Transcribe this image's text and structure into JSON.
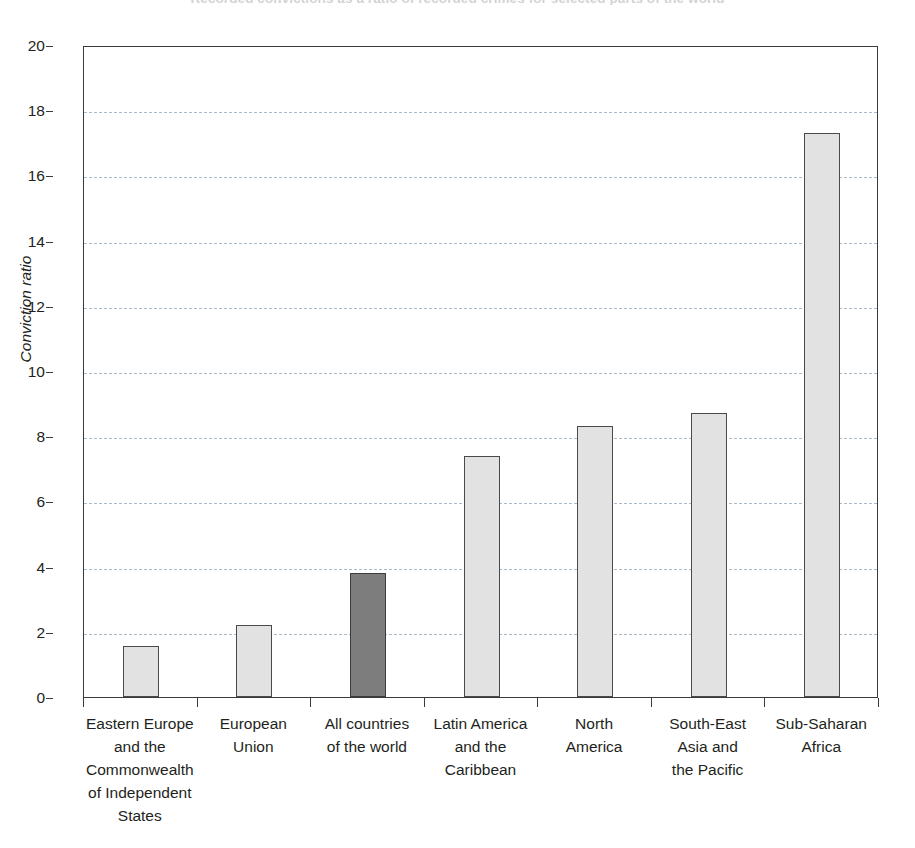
{
  "chart_data": {
    "type": "bar",
    "title": "Recorded convictions as a ratio of recorded crimes for selected parts of the world",
    "xlabel": "",
    "ylabel": "Conviction ratio",
    "ylim": [
      0,
      20
    ],
    "yticks": [
      0,
      2,
      4,
      6,
      8,
      10,
      12,
      14,
      16,
      18,
      20
    ],
    "grid": true,
    "legend_position": "none",
    "categories": [
      "Eastern Europe and the Commonwealth of Independent States",
      "European Union",
      "All countries of the world",
      "Latin America and the Caribbean",
      "North America",
      "South-East Asia and the Pacific",
      "Sub-Saharan Africa"
    ],
    "category_lines": [
      [
        "Eastern Europe",
        "and the",
        "Commonwealth",
        "of Independent",
        "States"
      ],
      [
        "European",
        "Union"
      ],
      [
        "All countries",
        "of the world"
      ],
      [
        "Latin America",
        "and the",
        "Caribbean"
      ],
      [
        "North",
        "America"
      ],
      [
        "South-East",
        "Asia and",
        "the Pacific"
      ],
      [
        "Sub-Saharan",
        "Africa"
      ]
    ],
    "values": [
      1.55,
      2.2,
      3.8,
      7.4,
      8.3,
      8.7,
      17.3
    ],
    "bar_styles": [
      "light",
      "light",
      "dark",
      "light",
      "light",
      "light",
      "light"
    ],
    "colors": {
      "bar_light_fill": "#e2e2e2",
      "bar_dark_fill": "#7d7d7d",
      "bar_border": "#4a4a4a",
      "gridline": "#a8b6c4",
      "axis": "#3b3b3b",
      "text": "#231f20"
    }
  }
}
